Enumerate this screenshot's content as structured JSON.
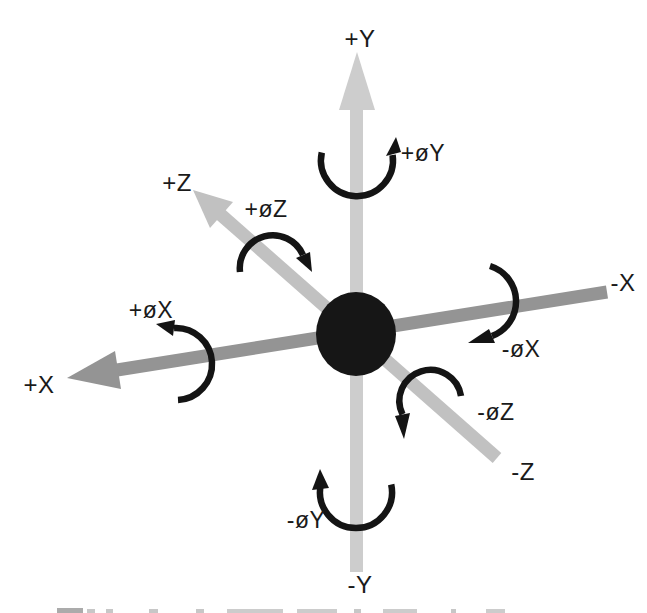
{
  "figure": {
    "labels": {
      "plus_y": "+Y",
      "minus_y": "-Y",
      "plus_x": "+X",
      "minus_x": "-X",
      "plus_z": "+Z",
      "minus_z": "-Z",
      "rot_plus_y": "+øY",
      "rot_minus_y": "-øY",
      "rot_plus_x": "+øX",
      "rot_minus_x": "-øX",
      "rot_plus_z": "+øZ",
      "rot_minus_z": "-øZ"
    },
    "colors": {
      "background": "#ffffff",
      "x_axis": "#949494",
      "y_axis": "#cdcdcd",
      "z_axis": "#c1c1c1",
      "origin_dot": "#161616",
      "rotation_arrow": "#141414",
      "label_text": "#1a1a1a"
    }
  }
}
